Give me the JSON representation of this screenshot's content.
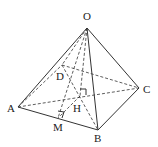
{
  "diagram": {
    "type": "pyramid",
    "labels": {
      "O": "O",
      "A": "A",
      "B": "B",
      "C": "C",
      "D": "D",
      "H": "H",
      "M": "M"
    },
    "points": {
      "O": [
        87,
        28
      ],
      "A": [
        18,
        107
      ],
      "B": [
        98,
        130
      ],
      "C": [
        139,
        88
      ],
      "D": [
        62,
        65
      ],
      "H": [
        80,
        96
      ],
      "M": [
        58,
        118
      ]
    },
    "solid_edges": [
      [
        "O",
        "A"
      ],
      [
        "O",
        "B"
      ],
      [
        "O",
        "C"
      ],
      [
        "A",
        "B"
      ],
      [
        "B",
        "C"
      ]
    ],
    "dashed_edges": [
      [
        "O",
        "D"
      ],
      [
        "A",
        "D"
      ],
      [
        "D",
        "C"
      ],
      [
        "A",
        "C"
      ],
      [
        "D",
        "B"
      ],
      [
        "O",
        "H"
      ],
      [
        "O",
        "M"
      ],
      [
        "H",
        "M"
      ]
    ],
    "right_angle_marks": [
      "H",
      "M"
    ]
  }
}
